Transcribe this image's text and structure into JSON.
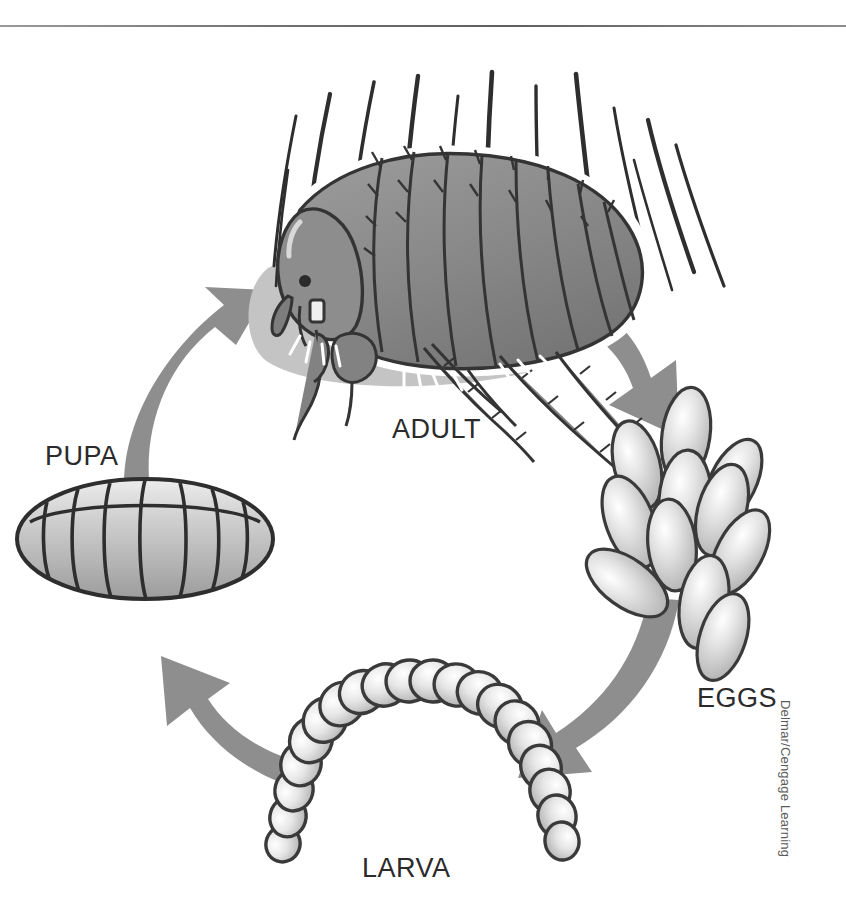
{
  "figure": {
    "credit": "Delmar/Cengage Learning",
    "background_color": "#ffffff",
    "rule_color": "#6e6e6e",
    "arrow_color": "#8e8e8e",
    "outline_color": "#3a3a3a",
    "body_fill": "#8a8a8a",
    "egg_fill": "#d8d8d8",
    "shadow_fill": "#c4c4c4"
  },
  "stages": [
    {
      "id": "adult",
      "label": "ADULT",
      "order": 1,
      "description": "Adult flea on skin surrounded by hairs",
      "x": 392,
      "y": 414
    },
    {
      "id": "eggs",
      "label": "EGGS",
      "order": 2,
      "description": "Cluster of eleven oval eggs",
      "x": 697,
      "y": 683
    },
    {
      "id": "larva",
      "label": "LARVA",
      "order": 3,
      "description": "Segmented arched larva",
      "x": 362,
      "y": 853
    },
    {
      "id": "pupa",
      "label": "PUPA",
      "order": 4,
      "description": "Ellipsoid pupal cocoon with segment bands",
      "x": 45,
      "y": 441
    }
  ],
  "arrows": [
    {
      "id": "adult-to-eggs",
      "from": "adult",
      "to": "eggs",
      "direction": "down-right"
    },
    {
      "id": "eggs-to-larva",
      "from": "eggs",
      "to": "larva",
      "direction": "down-left"
    },
    {
      "id": "larva-to-pupa",
      "from": "larva",
      "to": "pupa",
      "direction": "up-left"
    },
    {
      "id": "pupa-to-adult",
      "from": "pupa",
      "to": "adult",
      "direction": "up-right"
    }
  ],
  "counts": {
    "eggs": 11,
    "hairs": 13,
    "larva_segments": 22
  }
}
